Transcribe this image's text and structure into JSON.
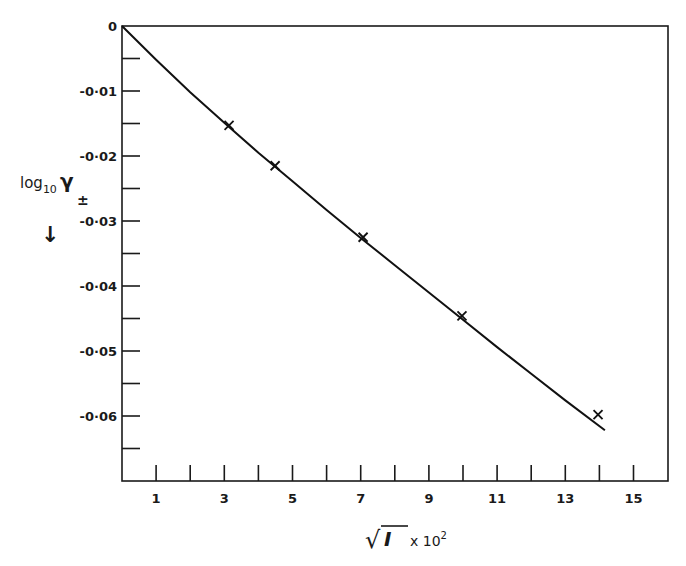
{
  "chart_data": {
    "type": "line",
    "title": "",
    "xlabel": "√I x 10²",
    "xlabel_parts": {
      "root": "√",
      "var": "I",
      "mult": "x 10",
      "exp": "2"
    },
    "ylabel": "log10 γ±",
    "ylabel_parts": {
      "base": "log",
      "sub": "10",
      "sym": "γ",
      "pm": "±",
      "arrow": "↓"
    },
    "xlim": [
      0,
      16
    ],
    "ylim": [
      -0.07,
      0
    ],
    "grid": false,
    "legend": null,
    "x_ticks_major": [
      1,
      3,
      5,
      7,
      9,
      11,
      13,
      15
    ],
    "x_ticks_minor": [
      1,
      2,
      3,
      4,
      5,
      6,
      7,
      8,
      9,
      10,
      11,
      12,
      13,
      14,
      15
    ],
    "x_tick_labels": [
      "1",
      "3",
      "5",
      "7",
      "9",
      "11",
      "13",
      "15"
    ],
    "y_ticks": [
      0,
      -0.005,
      -0.01,
      -0.015,
      -0.02,
      -0.025,
      -0.03,
      -0.035,
      -0.04,
      -0.045,
      -0.05,
      -0.055,
      -0.06,
      -0.065
    ],
    "y_tick_labels": [
      {
        "value": 0,
        "label": "0"
      },
      {
        "value": -0.01,
        "label": "-0·01"
      },
      {
        "value": -0.02,
        "label": "-0·02"
      },
      {
        "value": -0.03,
        "label": "-0·03"
      },
      {
        "value": -0.04,
        "label": "-0·04"
      },
      {
        "value": -0.05,
        "label": "-0·05"
      },
      {
        "value": -0.06,
        "label": "-0·06"
      }
    ],
    "series": [
      {
        "name": "measured",
        "marker": "x",
        "x": [
          3.14,
          4.49,
          7.07,
          9.97,
          13.96
        ],
        "values": [
          -0.0153,
          -0.0215,
          -0.0325,
          -0.0446,
          -0.0598
        ]
      },
      {
        "name": "fitted curve",
        "marker": "none",
        "x": [
          0,
          1,
          2,
          3,
          4,
          5,
          6,
          7,
          8,
          9,
          10,
          11,
          12,
          13,
          14.16
        ],
        "values": [
          0,
          -0.0052,
          -0.0102,
          -0.0149,
          -0.0195,
          -0.0239,
          -0.0283,
          -0.0326,
          -0.0368,
          -0.041,
          -0.0452,
          -0.0494,
          -0.0535,
          -0.0576,
          -0.0622
        ]
      }
    ]
  }
}
